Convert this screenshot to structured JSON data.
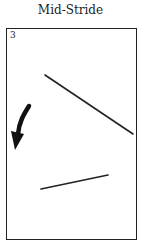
{
  "title": "Mid-Stride",
  "panel": {
    "number": "3",
    "icons": [
      "curved-arrow-down-left-icon"
    ],
    "lines": [
      {
        "name": "upper-diagonal-line",
        "x1": 45,
        "y1": 75,
        "x2": 133,
        "y2": 134
      },
      {
        "name": "lower-diagonal-line",
        "x1": 41,
        "y1": 189,
        "x2": 108,
        "y2": 175
      }
    ]
  },
  "colors": {
    "ink": "#222222",
    "background": "#ffffff"
  }
}
